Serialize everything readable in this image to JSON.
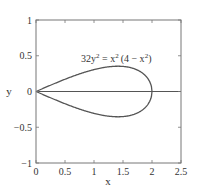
{
  "chart_data": {
    "type": "line",
    "title": "",
    "annotation": "32y² = x²(4 − x²)",
    "annotation_parts": {
      "a": "32y",
      "sup1": "2",
      "b": " = x",
      "sup2": "2",
      "c": "(4 − x",
      "sup3": "2",
      "d": ")"
    },
    "xlabel": "x",
    "ylabel": "y",
    "xlim": [
      0,
      2.5
    ],
    "ylim": [
      -1,
      1
    ],
    "xticks": [
      0,
      0.5,
      1,
      1.5,
      2,
      2.5
    ],
    "xtick_labels": [
      "0",
      "0.5",
      "1",
      "1.5",
      "2",
      "2.5"
    ],
    "yticks": [
      -1,
      -0.5,
      0,
      0.5,
      1
    ],
    "ytick_labels": [
      "−1",
      "−0.5",
      "0",
      "0.5",
      "1"
    ],
    "grid": false,
    "legend": null,
    "series": [
      {
        "name": "upper branch: y = sqrt(x²(4−x²)/32)",
        "x": [
          0,
          0.25,
          0.5,
          0.75,
          1.0,
          1.25,
          1.414,
          1.5,
          1.75,
          1.9,
          2.0
        ],
        "y": [
          0,
          0.088,
          0.171,
          0.246,
          0.306,
          0.345,
          0.354,
          0.351,
          0.296,
          0.208,
          0
        ]
      },
      {
        "name": "lower branch: y = -sqrt(x²(4−x²)/32)",
        "x": [
          0,
          0.25,
          0.5,
          0.75,
          1.0,
          1.25,
          1.414,
          1.5,
          1.75,
          1.9,
          2.0
        ],
        "y": [
          0,
          -0.088,
          -0.171,
          -0.246,
          -0.306,
          -0.345,
          -0.354,
          -0.351,
          -0.296,
          -0.208,
          0
        ]
      },
      {
        "name": "x-axis line y = 0",
        "x": [
          0,
          2.5
        ],
        "y": [
          0,
          0
        ]
      }
    ]
  },
  "colors": {
    "axis": "#666666",
    "curve": "#555555",
    "text": "#333333"
  }
}
